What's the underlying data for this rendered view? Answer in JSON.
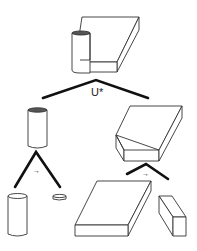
{
  "diagram": {
    "type": "CSG decomposition tree",
    "colors": {
      "background": "#ffffff",
      "outline": "#333333",
      "edge": "#111111"
    },
    "root": {
      "name": "combined-part",
      "description": "cylinder attached to a flat slab"
    },
    "root_operation": {
      "label": "U*"
    },
    "children": [
      {
        "name": "cylinder",
        "operation_label": "→",
        "children": [
          {
            "name": "tall-cylinder"
          },
          {
            "name": "thin-disc"
          }
        ]
      },
      {
        "name": "beveled-block",
        "operation_label": "→",
        "children": [
          {
            "name": "flat-slab"
          },
          {
            "name": "small-block"
          }
        ]
      }
    ]
  }
}
